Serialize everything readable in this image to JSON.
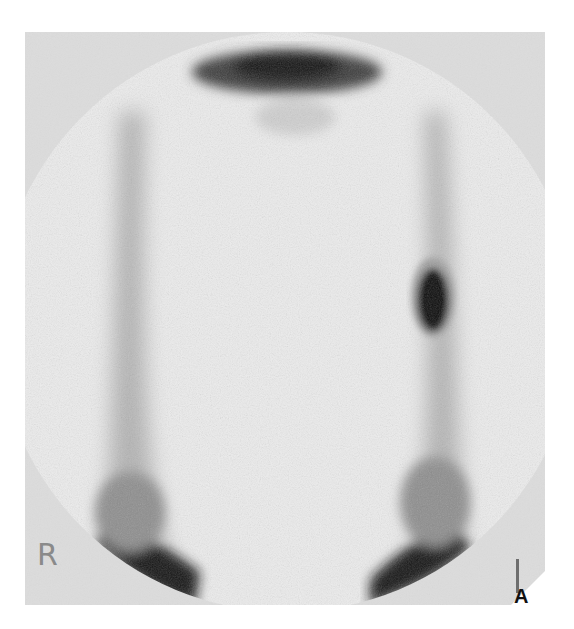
{
  "figure": {
    "panel_letter": "A",
    "image_type": "grayscale scintigraphy scan",
    "orientation_labels": {
      "left_marker": "R",
      "right_marker": "l"
    },
    "colors": {
      "background": "#ffffff",
      "panel_background": "#dcdcdc",
      "field_of_view": "#ececec",
      "uptake_dark": "#111111",
      "label_gray": "#8a8a8a"
    }
  }
}
